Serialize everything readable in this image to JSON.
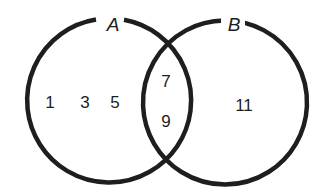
{
  "diagram": {
    "type": "venn",
    "sets": [
      {
        "name": "A",
        "only": [
          "1",
          "3",
          "5"
        ]
      },
      {
        "name": "B",
        "only": [
          "11"
        ]
      }
    ],
    "intersection": [
      "7",
      "9"
    ],
    "colors": {
      "stroke": "#1e1e1e",
      "background": "#ffffff"
    }
  }
}
